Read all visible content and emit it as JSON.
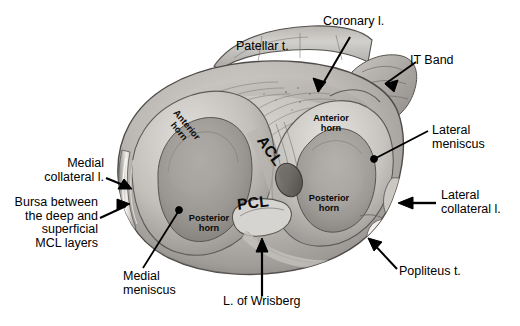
{
  "figure": {
    "background_color": "#ffffff",
    "label_color": "#000000"
  },
  "callouts": [
    {
      "id": "patellar-t",
      "text": "Patellar t.",
      "align": "left"
    },
    {
      "id": "coronary-l",
      "text": "Coronary l.",
      "align": "left"
    },
    {
      "id": "it-band",
      "text": "IT Band",
      "align": "left"
    },
    {
      "id": "lateral-meniscus",
      "text": "Lateral\nmeniscus",
      "align": "left"
    },
    {
      "id": "lateral-collateral-l",
      "text": "Lateral\ncollateral l.",
      "align": "left"
    },
    {
      "id": "popliteus-t",
      "text": "Popliteus t.",
      "align": "left"
    },
    {
      "id": "medial-collateral-l",
      "text": "Medial\ncollateral l.",
      "align": "right"
    },
    {
      "id": "bursa-mcl",
      "text": "Bursa between\nthe deep and\nsuperficial\nMCL layers",
      "align": "right"
    },
    {
      "id": "medial-meniscus",
      "text": "Medial\nmeniscus",
      "align": "left"
    },
    {
      "id": "l-of-wrisberg",
      "text": "L. of Wrisberg",
      "align": "left"
    }
  ],
  "structure_labels": [
    {
      "id": "anterior-horn-medial",
      "text": "Anterior\nhorn",
      "rotated": true
    },
    {
      "id": "anterior-horn-lateral",
      "text": "Anterior\nhorn",
      "rotated": false
    },
    {
      "id": "posterior-horn-medial",
      "text": "Posterior\nhorn",
      "rotated": false
    },
    {
      "id": "posterior-horn-lateral",
      "text": "Posterior\nhorn",
      "rotated": false
    },
    {
      "id": "acl",
      "text": "ACL",
      "rotated": true
    },
    {
      "id": "pcl",
      "text": "PCL",
      "rotated": false
    }
  ]
}
